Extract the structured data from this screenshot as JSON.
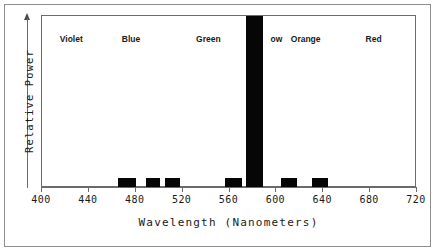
{
  "chart_data": {
    "type": "bar",
    "title": "",
    "xlabel": "Wavelength (Nanometers)",
    "ylabel": "Relative Power",
    "xlim": [
      400,
      720
    ],
    "ylim": [
      0,
      100
    ],
    "grid": false,
    "legend": "none",
    "xticks": [
      400,
      440,
      480,
      520,
      560,
      600,
      640,
      680,
      720
    ],
    "xtick_labels": [
      "400",
      "440",
      "480",
      "520",
      "560",
      "600",
      "640",
      "680",
      "720"
    ],
    "yticks": [],
    "ytick_labels": [],
    "annotations": [
      {
        "text": "Violet",
        "wavelength": 425
      },
      {
        "text": "Blue",
        "wavelength": 476
      },
      {
        "text": "Green",
        "wavelength": 542
      },
      {
        "text": "Yel",
        "wavelength": 580
      },
      {
        "text": "ow",
        "wavelength": 600
      },
      {
        "text": "Orange",
        "wavelength": 625
      },
      {
        "text": "Red",
        "wavelength": 683
      }
    ],
    "bars": [
      {
        "name": "bar-blue-1",
        "x_start": 465,
        "x_end": 480,
        "value": 6
      },
      {
        "name": "bar-blue-2",
        "x_start": 489,
        "x_end": 501,
        "value": 6
      },
      {
        "name": "bar-cyan",
        "x_start": 505,
        "x_end": 518,
        "value": 6
      },
      {
        "name": "bar-yellow-1",
        "x_start": 556,
        "x_end": 571,
        "value": 6
      },
      {
        "name": "bar-yellow-peak",
        "x_start": 574,
        "x_end": 589,
        "value": 100
      },
      {
        "name": "bar-orange",
        "x_start": 604,
        "x_end": 618,
        "value": 6
      },
      {
        "name": "bar-red",
        "x_start": 630,
        "x_end": 644,
        "value": 6
      }
    ],
    "colors": {
      "bar_fill": "#060606",
      "axis": "#6b6b6b",
      "frame": "#8e8e8e",
      "text": "#1a1a1a",
      "background": "#ffffff"
    }
  }
}
